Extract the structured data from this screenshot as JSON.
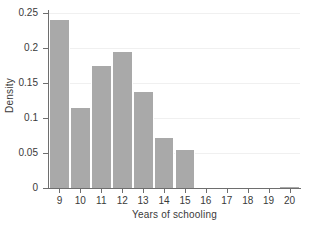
{
  "chart_data": {
    "type": "bar",
    "title": "",
    "xlabel": "Years of schooling",
    "ylabel": "Density",
    "categories": [
      "9",
      "10",
      "11",
      "12",
      "13",
      "14",
      "15",
      "16",
      "17",
      "18",
      "19",
      "20"
    ],
    "values": [
      0.24,
      0.114,
      0.174,
      0.194,
      0.137,
      0.071,
      0.054,
      0.0,
      0.0,
      0.0,
      0.0,
      0.002
    ],
    "xlim": [
      8.5,
      20.5
    ],
    "ylim": [
      0,
      0.25
    ],
    "xticks": [
      "9",
      "10",
      "11",
      "12",
      "13",
      "14",
      "15",
      "16",
      "17",
      "18",
      "19",
      "20"
    ],
    "yticks": [
      "0",
      "0.05",
      "0.1",
      "0.15",
      "0.2",
      "0.25"
    ],
    "ytick_values": [
      0,
      0.05,
      0.1,
      0.15,
      0.2,
      0.25
    ],
    "grid": true,
    "legend": "none",
    "bar_color": "#a9a9a9",
    "bar_edge_color": "#ffffff",
    "axis_color": "#6e6e6e",
    "background": "#ffffff"
  }
}
